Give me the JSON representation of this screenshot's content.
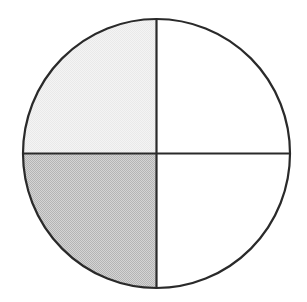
{
  "figure": {
    "name": "fraction-circle-diagram",
    "type": "pie",
    "background_color": "#ffffff",
    "stroke_color": "#2a2a2a",
    "stroke_width": 2.2,
    "circle": {
      "center_x": 156.5,
      "center_y": 153.5,
      "radius_x": 133.5,
      "radius_y": 134.5,
      "top_y": 19,
      "bottom_y": 288,
      "left_x": 23,
      "right_x": 290
    },
    "dividers": {
      "vertical_x": 156.5,
      "horizontal_y": 153.5
    }
  },
  "chart_data": {
    "type": "pie",
    "title": "",
    "subtitle": "",
    "xlabel": "",
    "ylabel": "",
    "grid": false,
    "legend_position": "none",
    "total_slices": 4,
    "slice_angle_degrees": 90,
    "categories": [
      "upper-left quadrant",
      "upper-right quadrant",
      "lower-left quadrant",
      "lower-right quadrant"
    ],
    "values": [
      25,
      25,
      25,
      25
    ],
    "fills": [
      "#f0f0f0",
      "#ffffff",
      "#c8c8c8",
      "#ffffff"
    ],
    "shaded_count": 1,
    "fraction_shaded": "1/4",
    "slices": [
      {
        "position": "upper-left",
        "start_angle_degrees": 180,
        "end_angle_degrees": 270,
        "value": 25,
        "fill": "#f0f0f0",
        "shading": "very-light-gray",
        "label": ""
      },
      {
        "position": "upper-right",
        "start_angle_degrees": 270,
        "end_angle_degrees": 360,
        "value": 25,
        "fill": "#ffffff",
        "shading": "white",
        "label": ""
      },
      {
        "position": "lower-left",
        "start_angle_degrees": 90,
        "end_angle_degrees": 180,
        "value": 25,
        "fill": "#c8c8c8",
        "shading": "medium-gray-dither",
        "label": ""
      },
      {
        "position": "lower-right",
        "start_angle_degrees": 0,
        "end_angle_degrees": 90,
        "value": 25,
        "fill": "#ffffff",
        "shading": "white",
        "label": ""
      }
    ],
    "annotations": []
  }
}
